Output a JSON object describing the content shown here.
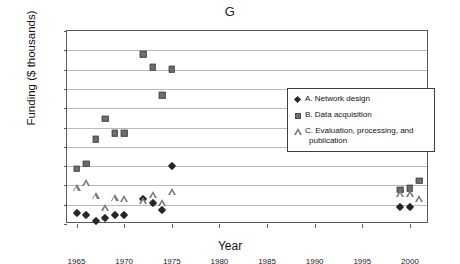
{
  "chart_data": {
    "type": "scatter",
    "title": "G",
    "xlabel": "Year",
    "ylabel": "Funding ($ thousands)",
    "xlim": [
      1964,
      2002
    ],
    "ylim": [
      0,
      20000
    ],
    "grid": true,
    "legend_position": "inside-upper-right",
    "xticks": [
      1965,
      1970,
      1975,
      1980,
      1985,
      1990,
      1995,
      2000
    ],
    "xtick_labels": [
      "1965",
      "1970",
      "1975",
      "1980",
      "1985",
      "1990",
      "1995",
      "2000"
    ],
    "yticks": [
      0,
      2000,
      4000,
      6000,
      8000,
      10000,
      12000,
      14000,
      16000,
      18000,
      20000
    ],
    "ytick_labels": [
      "0",
      "2,000",
      "4,000",
      "6,000",
      "8,000",
      "10,000",
      "12,000",
      "14,000",
      "16,000",
      "18,000",
      "20,000"
    ],
    "series": [
      {
        "name": "A. Network design",
        "key": "A",
        "marker": "diamond",
        "color": "#262626",
        "points": [
          {
            "x": 1965,
            "y": 1100
          },
          {
            "x": 1966,
            "y": 950
          },
          {
            "x": 1967,
            "y": 350
          },
          {
            "x": 1968,
            "y": 650
          },
          {
            "x": 1969,
            "y": 900
          },
          {
            "x": 1970,
            "y": 900
          },
          {
            "x": 1972,
            "y": 2550
          },
          {
            "x": 1973,
            "y": 2150
          },
          {
            "x": 1974,
            "y": 1500
          },
          {
            "x": 1975,
            "y": 5980
          },
          {
            "x": 1999,
            "y": 1750
          },
          {
            "x": 2000,
            "y": 1750
          }
        ]
      },
      {
        "name": "B. Data acquisition",
        "key": "B",
        "marker": "square",
        "color": "#6e6e6e",
        "points": [
          {
            "x": 1965,
            "y": 5750
          },
          {
            "x": 1966,
            "y": 6250
          },
          {
            "x": 1967,
            "y": 8780
          },
          {
            "x": 1968,
            "y": 10900
          },
          {
            "x": 1969,
            "y": 9400
          },
          {
            "x": 1970,
            "y": 9400
          },
          {
            "x": 1972,
            "y": 17600
          },
          {
            "x": 1973,
            "y": 16250
          },
          {
            "x": 1974,
            "y": 13350
          },
          {
            "x": 1975,
            "y": 16050
          },
          {
            "x": 1999,
            "y": 3550
          },
          {
            "x": 2000,
            "y": 3700
          },
          {
            "x": 2001,
            "y": 4500
          }
        ]
      },
      {
        "name": "C. Evaluation, processing, and publication",
        "key": "C",
        "marker": "triangle",
        "color": "#7a7a7a",
        "points": [
          {
            "x": 1965,
            "y": 3050
          },
          {
            "x": 1966,
            "y": 3500
          },
          {
            "x": 1967,
            "y": 2200
          },
          {
            "x": 1968,
            "y": 950
          },
          {
            "x": 1969,
            "y": 1950
          },
          {
            "x": 1970,
            "y": 1900
          },
          {
            "x": 1972,
            "y": 1700
          },
          {
            "x": 1973,
            "y": 2250
          },
          {
            "x": 1974,
            "y": 1500
          },
          {
            "x": 1975,
            "y": 2600
          },
          {
            "x": 1999,
            "y": 2400
          },
          {
            "x": 2000,
            "y": 2350
          },
          {
            "x": 2001,
            "y": 1850
          }
        ]
      }
    ]
  },
  "legend": {
    "entries": [
      {
        "label": "A. Network design",
        "cont": ""
      },
      {
        "label": "B. Data acquisition",
        "cont": ""
      },
      {
        "label": "C. Evaluation, processing, and",
        "cont": "publication"
      }
    ]
  }
}
